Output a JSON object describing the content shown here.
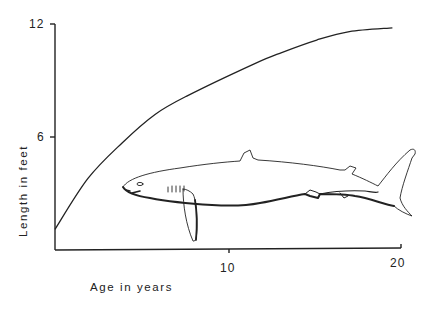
{
  "chart_data": {
    "type": "line",
    "title": "",
    "xlabel": "Age in years",
    "ylabel": "Length in feet",
    "xlim": [
      0,
      20
    ],
    "ylim": [
      0,
      12
    ],
    "x_ticks": [
      10,
      20
    ],
    "y_ticks": [
      6,
      12
    ],
    "x_tick_labels": [
      "10",
      "20"
    ],
    "y_tick_labels": [
      "6",
      "12"
    ],
    "grid": false,
    "legend": null,
    "series": [
      {
        "name": "Growth curve",
        "x": [
          0,
          1.8,
          3.8,
          5.7,
          7.6,
          11.5,
          13.1,
          15.1,
          17.0,
          19.5
        ],
        "y": [
          1.1,
          3.8,
          5.7,
          7.2,
          8.2,
          9.9,
          10.5,
          11.15,
          11.6,
          11.8
        ]
      }
    ],
    "annotations": [
      "shark illustration (line drawing) below curve"
    ]
  },
  "axes": {
    "x_title": "Age in years",
    "y_title": "Length in feet",
    "x_ticks": [
      "10",
      "20"
    ],
    "y_ticks": [
      "6",
      "12"
    ]
  },
  "illustration": {
    "subject": "shark-icon"
  }
}
